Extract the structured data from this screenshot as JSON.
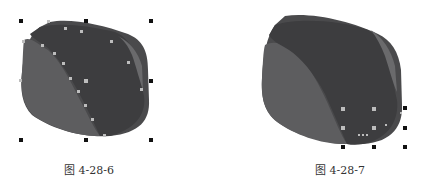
{
  "figures": [
    {
      "id": "fig1",
      "caption": "图 4-28-6",
      "state": "shape selected with all nodes shown, 8 bounding-box handles"
    },
    {
      "id": "fig2",
      "caption": "图 4-28-7",
      "state": "small node region selected at bottom-right, 8 bounding-box handles"
    }
  ],
  "colors": {
    "shape_outer": "#4a4a4c",
    "shape_left_face": "#5c5c5e",
    "shape_dark_face": "#3c3c3e",
    "shape_rim": "#6a6a6c",
    "handle": "#111111",
    "node": "#bdbdbd"
  }
}
